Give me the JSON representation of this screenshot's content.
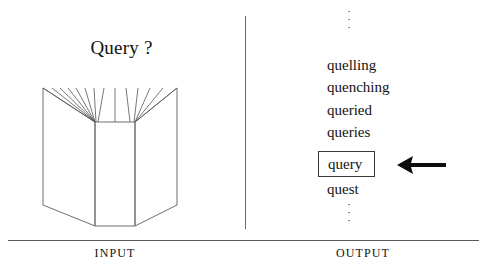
{
  "diagram": {
    "title_label": "Query ?",
    "divider": "vertical-divider",
    "accent_color": "#111111",
    "line_color": "#6c6c6c",
    "background_color": "#ffffff"
  },
  "input_panel": {
    "caption": "INPUT",
    "illustration_name": "open-book-icon",
    "query_text": "Query ?"
  },
  "output_panel": {
    "caption": "OUTPUT",
    "ellipsis_top": [
      "·",
      "·",
      "·"
    ],
    "ellipsis_bottom": [
      "·",
      "·",
      "·"
    ],
    "words": [
      {
        "text": "quelling",
        "selected": false
      },
      {
        "text": "quenching",
        "selected": false
      },
      {
        "text": "queried",
        "selected": false
      },
      {
        "text": "queries",
        "selected": false
      },
      {
        "text": "query",
        "selected": true
      },
      {
        "text": "quest",
        "selected": false
      }
    ],
    "selected_word": "query",
    "arrow_direction": "left"
  }
}
